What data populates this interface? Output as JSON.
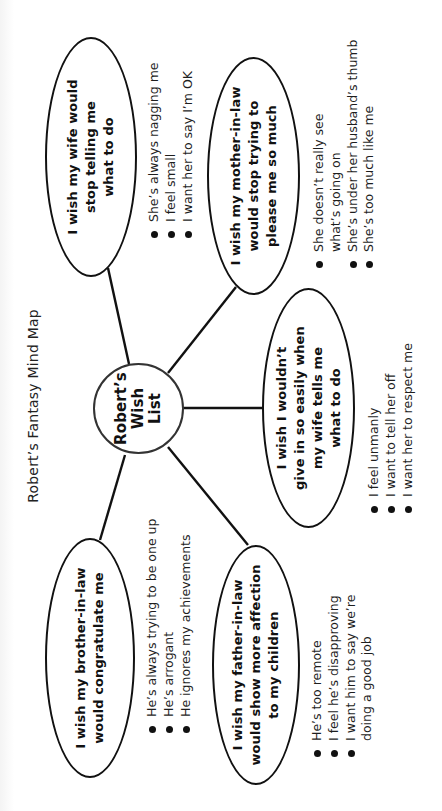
{
  "title": "Robert’s Fantasy Mind Map",
  "center": {
    "label": "Robert’s\nWish\nList"
  },
  "nodes": {
    "wife": {
      "label": "I wish my wife would\nstop telling me\nwhat to do",
      "bullets": [
        "She’s always nagging me",
        "I feel small",
        "I want her to say I’m OK"
      ]
    },
    "mother_in_law": {
      "label": "I wish my mother-in-law\nwould stop trying to\nplease me so much",
      "bullets": [
        "She doesn’t really see",
        "She’s under her husband’s thumb",
        "She’s too much like me"
      ],
      "bullet_0_continuation": "what’s going on"
    },
    "give_in": {
      "label": "I wish I wouldn’t\ngive in so easily when\nmy wife tells me\nwhat to do",
      "bullets": [
        "I feel unmanly",
        "I want to tell her off",
        "I want her to respect me"
      ]
    },
    "brother_in_law": {
      "label": "I wish my brother-in-law\nwould congratulate me",
      "bullets": [
        "He’s always trying to be one up",
        "He’s arrogant",
        "He ignores my achievements"
      ]
    },
    "father_in_law": {
      "label": "I wish my father-in-law\nwould show more affection\nto my children",
      "bullets": [
        "He’s too remote",
        "I feel he’s disapproving",
        "I want him to say we’re"
      ],
      "bullet_2_continuation": "doing a good job"
    }
  },
  "colors": {
    "stroke": "#111111",
    "background": "#ffffff",
    "text": "#1a1a1a"
  }
}
